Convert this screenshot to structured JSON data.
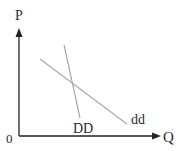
{
  "diagram": {
    "type": "supply-demand",
    "axes": {
      "y_label": "P",
      "x_label": "Q",
      "origin_label": "0"
    },
    "curves": [
      {
        "name": "DD",
        "label": "DD",
        "description": "steeper demand curve",
        "color": "#9a9a9a"
      },
      {
        "name": "dd",
        "label": "dd",
        "description": "flatter demand curve",
        "color": "#a8a8a8"
      }
    ],
    "colors": {
      "axis": "#222222",
      "text": "#2a2a2a"
    }
  }
}
